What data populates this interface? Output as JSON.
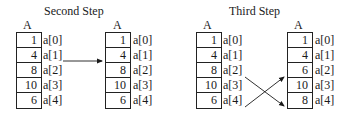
{
  "panels": [
    {
      "title": "Second Step",
      "arrays": [
        {
          "name": "A",
          "values": [
            "1",
            "4",
            "8",
            "10",
            "6"
          ],
          "labels": [
            "a[0]",
            "a[1]",
            "a[2]",
            "a[3]",
            "a[4]"
          ]
        },
        {
          "name": "A",
          "values": [
            "1",
            "4",
            "8",
            "10",
            "6"
          ],
          "labels": [
            "a[0]",
            "a[1]",
            "a[2]",
            "a[3]",
            "a[4]"
          ]
        }
      ],
      "arrows": [
        {
          "from": "a[1]",
          "to": "a[1]"
        }
      ]
    },
    {
      "title": "Third Step",
      "arrays": [
        {
          "name": "A",
          "values": [
            "1",
            "4",
            "8",
            "10",
            "6"
          ],
          "labels": [
            "a[0]",
            "a[1]",
            "a[2]",
            "a[3]",
            "a[4]"
          ]
        },
        {
          "name": "A",
          "values": [
            "1",
            "4",
            "6",
            "10",
            "8"
          ],
          "labels": [
            "a[0]",
            "a[1]",
            "a[2]",
            "a[3]",
            "a[4]"
          ]
        }
      ],
      "arrows": [
        {
          "from": "a[2]",
          "to": "a[4]"
        },
        {
          "from": "a[4]",
          "to": "a[2]"
        }
      ]
    }
  ]
}
